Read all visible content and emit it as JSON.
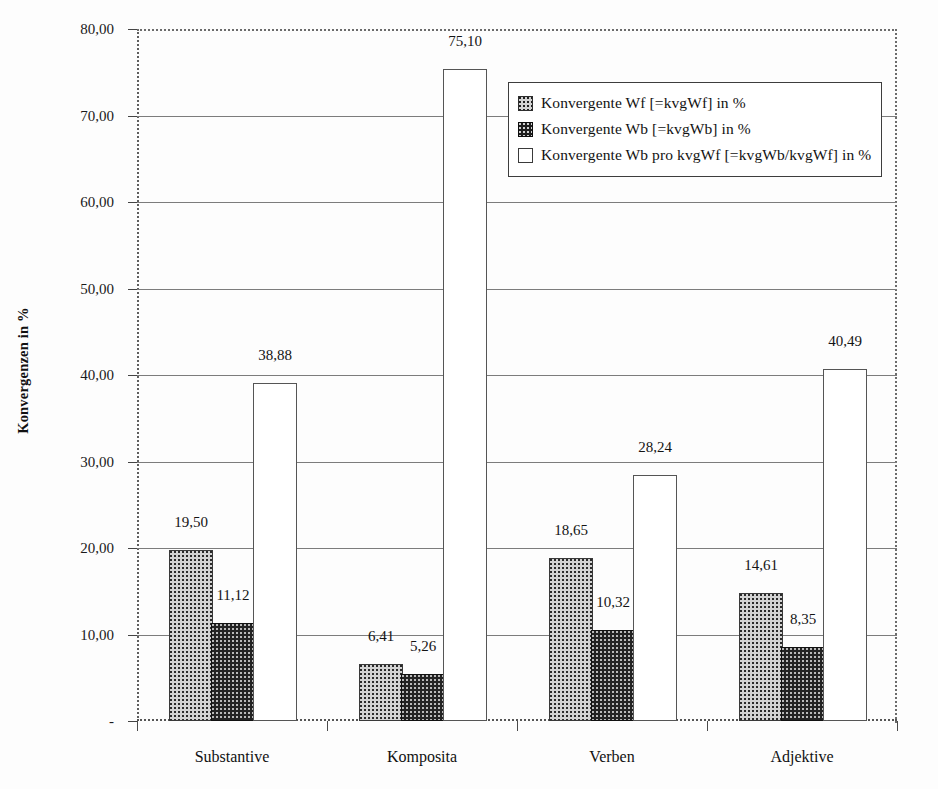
{
  "chart_data": {
    "type": "bar",
    "title": "",
    "subtitle": "",
    "xlabel": "",
    "ylabel": "Konvergenzen in %",
    "ylim": [
      0,
      80
    ],
    "ytick_step": 10,
    "ytick_labels": [
      "-",
      "10,00",
      "20,00",
      "30,00",
      "40,00",
      "50,00",
      "60,00",
      "70,00",
      "80,00"
    ],
    "ytick_values": [
      0,
      10,
      20,
      30,
      40,
      50,
      60,
      70,
      80
    ],
    "grid": "horizontal",
    "legend_position": "upper-right-inside",
    "decimal_separator": ",",
    "categories": [
      "Substantive",
      "Komposita",
      "Verben",
      "Adjektive"
    ],
    "series": [
      {
        "name": "Konvergente Wf [=kvgWf] in %",
        "values": [
          19.5,
          6.41,
          18.65,
          14.61
        ],
        "labels": [
          "19,50",
          "6,41",
          "18,65",
          "14,61"
        ],
        "fill": "light-dotted",
        "color": "#d2d2d2"
      },
      {
        "name": "Konvergente Wb [=kvgWb] in %",
        "values": [
          11.12,
          5.26,
          10.32,
          8.35
        ],
        "labels": [
          "11,12",
          "5,26",
          "10,32",
          "8,35"
        ],
        "fill": "dark-dotted",
        "color": "#232323"
      },
      {
        "name": "Konvergente Wb pro kvgWf [=kvgWb/kvgWf] in %",
        "values": [
          38.88,
          75.1,
          28.24,
          40.49
        ],
        "labels": [
          "38,88",
          "75,10",
          "28,24",
          "40,49"
        ],
        "fill": "empty",
        "color": "#ffffff"
      }
    ]
  },
  "axis": {
    "y_title": "Konvergenzen in %"
  },
  "legend": {
    "entries": [
      {
        "label": "Konvergente Wf [=kvgWf] in %",
        "swatch": "legend-swatch-series-1"
      },
      {
        "label": "Konvergente Wb [=kvgWb] in %",
        "swatch": "legend-swatch-series-2"
      },
      {
        "label": "Konvergente Wb pro kvgWf [=kvgWb/kvgWf] in %",
        "swatch": "legend-swatch-series-3"
      }
    ]
  }
}
